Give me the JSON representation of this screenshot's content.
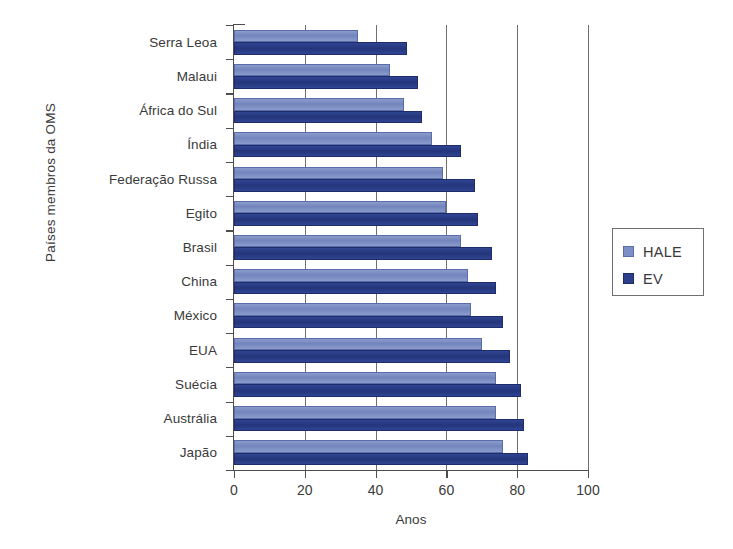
{
  "chart_data": {
    "type": "bar",
    "orientation": "horizontal",
    "title": "",
    "xlabel": "Anos",
    "ylabel": "Países membros da OMS",
    "xlim": [
      0,
      100
    ],
    "xticks": [
      0,
      20,
      40,
      60,
      80,
      100
    ],
    "grid": "vertical",
    "legend_position": "right",
    "categories": [
      "Serra Leoa",
      "Malaui",
      "África do Sul",
      "Índia",
      "Federação Russa",
      "Egito",
      "Brasil",
      "China",
      "México",
      "EUA",
      "Suécia",
      "Austrália",
      "Japão"
    ],
    "series": [
      {
        "name": "HALE",
        "color": "#7d90c6",
        "values": [
          35,
          44,
          48,
          56,
          59,
          60,
          64,
          66,
          67,
          70,
          74,
          74,
          76
        ]
      },
      {
        "name": "EV",
        "color": "#2b3f8c",
        "values": [
          49,
          52,
          53,
          64,
          68,
          69,
          73,
          74,
          76,
          78,
          81,
          82,
          83
        ]
      }
    ]
  },
  "legend": {
    "items": [
      {
        "label": "HALE",
        "color": "#7d90c6"
      },
      {
        "label": "EV",
        "color": "#2b3f8c"
      }
    ]
  }
}
